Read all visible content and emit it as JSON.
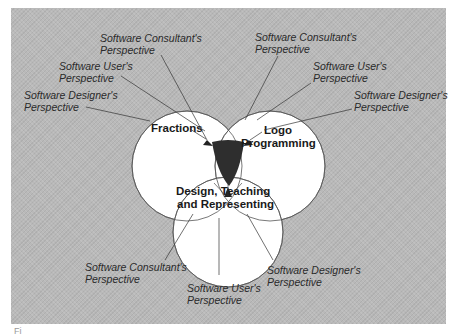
{
  "colors": {
    "background": "#b9b9b9",
    "circle_fill": "#ffffff",
    "intersection_fill": "#2e2e2e",
    "line": "#333333"
  },
  "circles": [
    {
      "id": "fractions",
      "label_lines": [
        "Fractions"
      ]
    },
    {
      "id": "logo",
      "label_lines": [
        "Logo",
        "Programming"
      ]
    },
    {
      "id": "design",
      "label_lines": [
        "Design, Teaching",
        "and Representing"
      ]
    }
  ],
  "perspectives": {
    "fractions": [
      {
        "lines": [
          "Software Consultant's",
          "Perspective"
        ]
      },
      {
        "lines": [
          "Software User's",
          "Perspective"
        ]
      },
      {
        "lines": [
          "Software Designer's",
          "Perspective"
        ]
      }
    ],
    "logo": [
      {
        "lines": [
          "Software Consultant's",
          "Perspective"
        ]
      },
      {
        "lines": [
          "Software User's",
          "Perspective"
        ]
      },
      {
        "lines": [
          "Software Designer's",
          "Perspective"
        ]
      }
    ],
    "design": [
      {
        "lines": [
          "Software Consultant's",
          "Perspective"
        ]
      },
      {
        "lines": [
          "Software User's",
          "Perspective"
        ]
      },
      {
        "lines": [
          "Software Designer's",
          "Perspective"
        ]
      }
    ]
  },
  "caption_fragment": "Fi"
}
